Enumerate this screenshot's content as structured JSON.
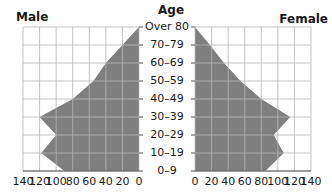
{
  "chart_data": {
    "type": "bar",
    "subtype": "population-pyramid",
    "title": "",
    "categories": [
      "0–9",
      "10–19",
      "20–29",
      "30–39",
      "40–49",
      "50–59",
      "60–69",
      "70–79",
      "Over 80"
    ],
    "category_axis_label": "Age",
    "series": [
      {
        "name": "Male",
        "side": "left",
        "values": [
          90,
          118,
          100,
          120,
          80,
          55,
          40,
          20,
          0
        ]
      },
      {
        "name": "Female",
        "side": "right",
        "values": [
          85,
          107,
          95,
          115,
          80,
          55,
          35,
          18,
          0
        ]
      }
    ],
    "xlim": [
      0,
      140
    ],
    "x_ticks_male": [
      "140",
      "120",
      "100",
      "80",
      "60",
      "40",
      "20",
      "0"
    ],
    "x_ticks_female": [
      "0",
      "20",
      "40",
      "60",
      "80",
      "100",
      "120",
      "140"
    ],
    "grid": true,
    "fill_color": "#7f7f7f",
    "grid_color": "#b5b5b5",
    "style": "filled area outline (pyramid)"
  },
  "labels": {
    "male": "Male",
    "female": "Female",
    "age": "Age",
    "ages_top_to_bottom": [
      "Over 80",
      "70–79",
      "60–69",
      "50–59",
      "40–49",
      "30–39",
      "20–29",
      "10–19",
      "0–9"
    ]
  }
}
